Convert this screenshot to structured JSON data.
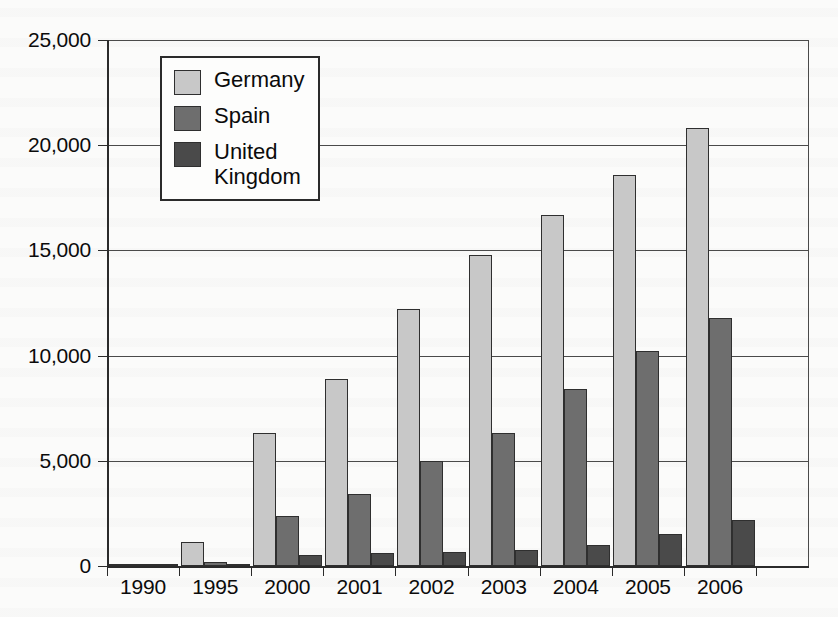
{
  "chart_data": {
    "type": "bar",
    "title": "",
    "subtitle": "",
    "xlabel": "",
    "ylabel": "",
    "categories": [
      "1990",
      "1995",
      "2000",
      "2001",
      "2002",
      "2003",
      "2004",
      "2005",
      "2006"
    ],
    "series": [
      {
        "name": "Germany",
        "color": "#c8c8c8",
        "values": [
          60,
          1150,
          6300,
          8900,
          12200,
          14800,
          16700,
          18600,
          20800
        ]
      },
      {
        "name": "Spain",
        "color": "#6e6e6e",
        "values": [
          50,
          200,
          2400,
          3400,
          5000,
          6300,
          8400,
          10200,
          11800
        ]
      },
      {
        "name": "United\nKingdom",
        "color": "#4a4a4a",
        "values": [
          40,
          60,
          500,
          620,
          650,
          750,
          1000,
          1500,
          2200
        ]
      }
    ],
    "ylim": [
      0,
      25000
    ],
    "ytick_values": [
      0,
      5000,
      10000,
      15000,
      20000,
      25000
    ],
    "ytick_labels": [
      "0",
      "5,000",
      "10,000",
      "15,000",
      "20,000",
      "25,000"
    ],
    "grid": true,
    "grid_axis": "y",
    "legend_position": "top-left-inside",
    "legend_entries": [
      "Germany",
      "Spain",
      "United\nKingdom"
    ],
    "bar_border_color": "#2f2f2f",
    "axis_color": "#2b2b2b",
    "background_color": "#fbfbfa"
  }
}
